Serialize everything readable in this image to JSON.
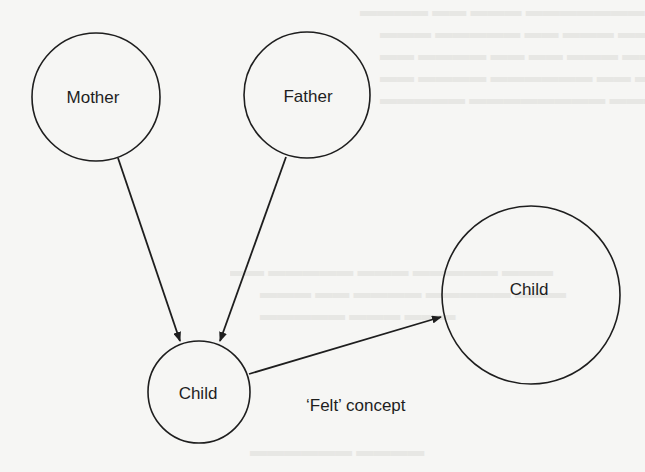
{
  "diagram": {
    "nodes": [
      {
        "id": "mother",
        "label": "Mother",
        "cx": 96,
        "cy": 97,
        "r": 64
      },
      {
        "id": "father",
        "label": "Father",
        "cx": 307,
        "cy": 95,
        "r": 63
      },
      {
        "id": "child_small",
        "label": "Child",
        "cx": 199,
        "cy": 392,
        "r": 51
      },
      {
        "id": "child_large",
        "label": "Child",
        "cx": 531,
        "cy": 295,
        "r": 89
      }
    ],
    "edges": [
      {
        "from": "mother",
        "to": "child_small",
        "x1": 118,
        "y1": 158,
        "x2": 180,
        "y2": 341
      },
      {
        "from": "father",
        "to": "child_small",
        "x1": 286,
        "y1": 157,
        "x2": 220,
        "y2": 341
      },
      {
        "from": "child_small",
        "to": "child_large",
        "x1": 249,
        "y1": 374,
        "x2": 441,
        "y2": 317
      }
    ],
    "caption": {
      "text": "‘Felt’ concept",
      "x": 306,
      "y": 411
    }
  },
  "colors": {
    "background": "#f6f6f4",
    "stroke": "#1e1e1e",
    "text": "#1e1e1e"
  }
}
